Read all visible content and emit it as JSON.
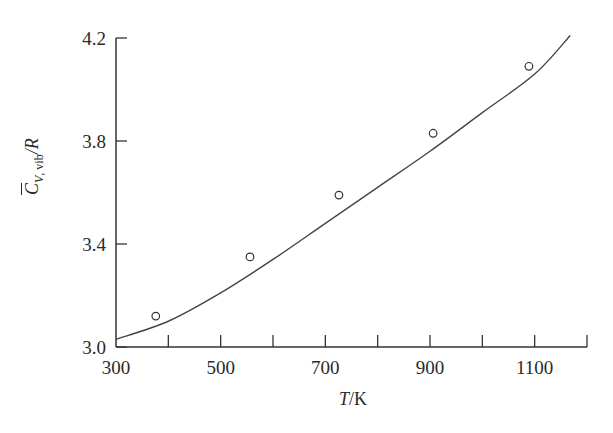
{
  "chart_data": {
    "type": "line",
    "title": "",
    "xlabel": "T/K",
    "ylabel": "C̄V,vib/R",
    "xlim": [
      300,
      1200
    ],
    "ylim": [
      3.0,
      4.2
    ],
    "x_ticks": [
      300,
      400,
      500,
      600,
      700,
      800,
      900,
      1000,
      1100,
      1200
    ],
    "x_tick_labels": [
      "300",
      "500",
      "700",
      "900",
      "1100"
    ],
    "y_ticks": [
      3.0,
      3.4,
      3.8,
      4.2
    ],
    "y_tick_labels": [
      "3.0",
      "3.4",
      "3.8",
      "4.2"
    ],
    "grid": false,
    "legend": null,
    "series": [
      {
        "name": "theory curve",
        "style": "solid line",
        "x": [
          300,
          400,
          500,
          600,
          700,
          800,
          900,
          1000,
          1100,
          1168
        ],
        "y": [
          3.03,
          3.1,
          3.21,
          3.34,
          3.48,
          3.62,
          3.76,
          3.91,
          4.06,
          4.21
        ]
      },
      {
        "name": "experimental data",
        "style": "open circles",
        "x": [
          376,
          556,
          726,
          906,
          1089
        ],
        "y": [
          3.12,
          3.35,
          3.59,
          3.83,
          4.09
        ]
      }
    ]
  },
  "axes": {
    "x_label_italic": "T",
    "x_label_unit": "/K",
    "y_label_symbol": "C",
    "y_label_sub": "V, vib",
    "y_label_tail": "/R"
  }
}
